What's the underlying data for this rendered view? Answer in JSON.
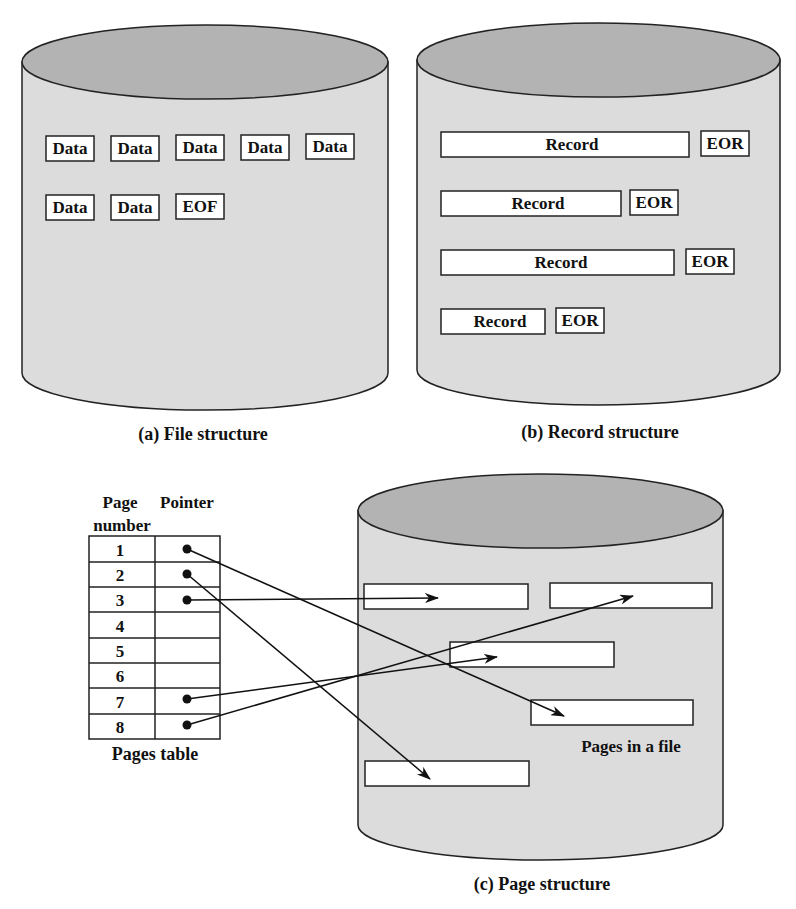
{
  "colors": {
    "cylinder_body": "#dcdcdc",
    "cylinder_top": "#b3b3b3",
    "outline": "#222222",
    "box_fill": "#ffffff",
    "text": "#111111"
  },
  "panel_a": {
    "caption": "(a) File structure",
    "row1": [
      "Data",
      "Data",
      "Data",
      "Data",
      "Data"
    ],
    "row2": [
      "Data",
      "Data",
      "EOF"
    ]
  },
  "panel_b": {
    "caption": "(b) Record structure",
    "records": [
      {
        "label": "Record",
        "marker": "EOR"
      },
      {
        "label": "Record",
        "marker": "EOR"
      },
      {
        "label": "Record",
        "marker": "EOR"
      },
      {
        "label": "Record",
        "marker": "EOR"
      }
    ]
  },
  "panel_c": {
    "caption": "(c) Page structure",
    "table": {
      "header_page": "Page",
      "header_number": "number",
      "header_pointer": "Pointer",
      "rows": [
        {
          "page": "1",
          "has_pointer": true
        },
        {
          "page": "2",
          "has_pointer": true
        },
        {
          "page": "3",
          "has_pointer": true
        },
        {
          "page": "4",
          "has_pointer": false
        },
        {
          "page": "5",
          "has_pointer": false
        },
        {
          "page": "6",
          "has_pointer": false
        },
        {
          "page": "7",
          "has_pointer": true
        },
        {
          "page": "8",
          "has_pointer": true
        }
      ],
      "caption": "Pages table"
    },
    "file_label": "Pages in a file"
  }
}
